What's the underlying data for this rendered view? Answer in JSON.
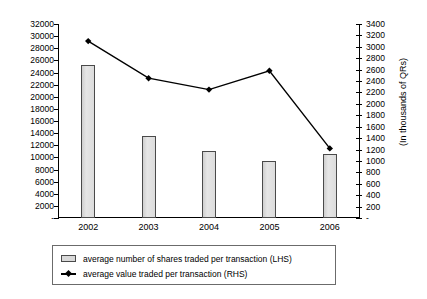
{
  "chart_data": {
    "type": "bar",
    "title": "",
    "xlabel": "",
    "categories": [
      "2002",
      "2003",
      "2004",
      "2005",
      "2006"
    ],
    "grid": false,
    "legend_position": "bottom",
    "series": [
      {
        "name": "average number of shares traded per transaction (LHS)",
        "type": "bar",
        "axis": "left",
        "values": [
          25200,
          13500,
          11000,
          9400,
          10600
        ]
      },
      {
        "name": "average value traded per transaction (RHS)",
        "type": "line",
        "axis": "right",
        "values": [
          3100,
          2450,
          2250,
          2580,
          1220
        ]
      }
    ],
    "left_axis": {
      "label": "",
      "ylim": [
        0,
        32000
      ],
      "tick_step": 2000,
      "ticks": [
        "-",
        "2000",
        "4000",
        "6000",
        "8000",
        "10000",
        "12000",
        "14000",
        "16000",
        "18000",
        "20000",
        "22000",
        "24000",
        "26000",
        "28000",
        "30000",
        "32000"
      ]
    },
    "right_axis": {
      "label": "(In thousands of QRs)",
      "ylim": [
        0,
        3400
      ],
      "tick_step": 200,
      "ticks": [
        "-",
        "200",
        "400",
        "600",
        "800",
        "1000",
        "1200",
        "1400",
        "1600",
        "1800",
        "2000",
        "2200",
        "2400",
        "2600",
        "2800",
        "3000",
        "3200",
        "3400"
      ]
    },
    "colors": {
      "bar_fill": "#d9d9d9",
      "bar_border": "#4a4a4a",
      "line": "#000000",
      "marker": "#000000",
      "axis": "#000000",
      "background": "#ffffff"
    }
  },
  "legend": {
    "items": [
      {
        "label": "average number of shares traded per transaction (LHS)",
        "marker": "bar-swatch-icon"
      },
      {
        "label": "average value traded per transaction (RHS)",
        "marker": "line-diamond-icon"
      }
    ]
  }
}
